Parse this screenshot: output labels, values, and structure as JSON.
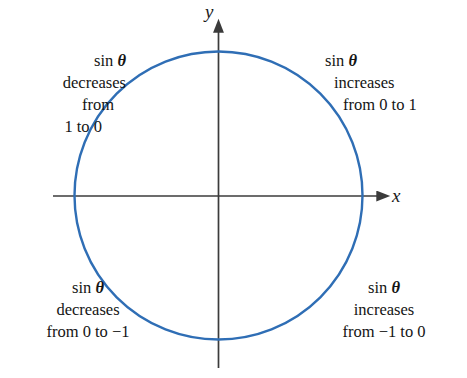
{
  "figure": {
    "background_color": "#ffffff",
    "width": 467,
    "height": 378
  },
  "colors": {
    "circle_stroke": "#2f6eb5",
    "axis_stroke": "#3b3b3b",
    "text": "#141414"
  },
  "axes": {
    "x_label": "x",
    "y_label": "y",
    "x_line": {
      "x1": 53,
      "y1": 196,
      "x2": 383,
      "y2": 196
    },
    "y_line": {
      "x1": 218,
      "y1": 26,
      "x2": 218,
      "y2": 368
    },
    "arrow_heads": [
      "x-positive",
      "y-positive"
    ]
  },
  "circle": {
    "center_x": 218,
    "center_y": 195,
    "radius": 144,
    "stroke_width": 2.4
  },
  "quadrant_notes": {
    "q1": {
      "name": "quadrant-1-note",
      "position": "top-right",
      "lines": [
        "sin θ",
        "increases",
        "from 0 to 1"
      ],
      "prefix": "sin",
      "symbol": "θ",
      "trend": "increases",
      "range_text": "from 0 to 1",
      "from_value": 0,
      "to_value": 1
    },
    "q2": {
      "name": "quadrant-2-note",
      "position": "top-left",
      "lines": [
        "sin θ",
        "decreases",
        "from",
        "1 to 0"
      ],
      "prefix": "sin",
      "symbol": "θ",
      "trend": "decreases",
      "range_text": "from 1 to 0",
      "from_value": 1,
      "to_value": 0
    },
    "q3": {
      "name": "quadrant-3-note",
      "position": "bottom-left",
      "lines": [
        "sin θ",
        "decreases",
        "from 0 to −1"
      ],
      "prefix": "sin",
      "symbol": "θ",
      "trend": "decreases",
      "range_text": "from 0 to −1",
      "from_value": 0,
      "to_value": -1
    },
    "q4": {
      "name": "quadrant-4-note",
      "position": "bottom-right",
      "lines": [
        "sin θ",
        "increases",
        "from −1 to 0"
      ],
      "prefix": "sin",
      "symbol": "θ",
      "trend": "increases",
      "range_text": "from −1 to 0",
      "from_value": -1,
      "to_value": 0
    }
  },
  "chart_data": {
    "type": "line",
    "xlabel": "x",
    "ylabel": "y",
    "xlim": [
      -1.15,
      1.3
    ],
    "ylim": [
      -1.2,
      1.2
    ],
    "grid": false,
    "legend": null,
    "series": [
      {
        "name": "unit circle",
        "shape": "circle",
        "center": [
          0,
          0
        ],
        "radius": 1,
        "color": "#2f6eb5"
      }
    ],
    "annotations": [
      {
        "quadrant": 1,
        "text": "sin θ increases from 0 to 1",
        "x": 0.75,
        "y": 0.78
      },
      {
        "quadrant": 2,
        "text": "sin θ decreases from 1 to 0",
        "x": -0.78,
        "y": 0.78
      },
      {
        "quadrant": 3,
        "text": "sin θ decreases from 0 to −1",
        "x": -0.72,
        "y": -0.72
      },
      {
        "quadrant": 4,
        "text": "sin θ increases from −1 to 0",
        "x": 0.72,
        "y": -0.72
      }
    ]
  }
}
